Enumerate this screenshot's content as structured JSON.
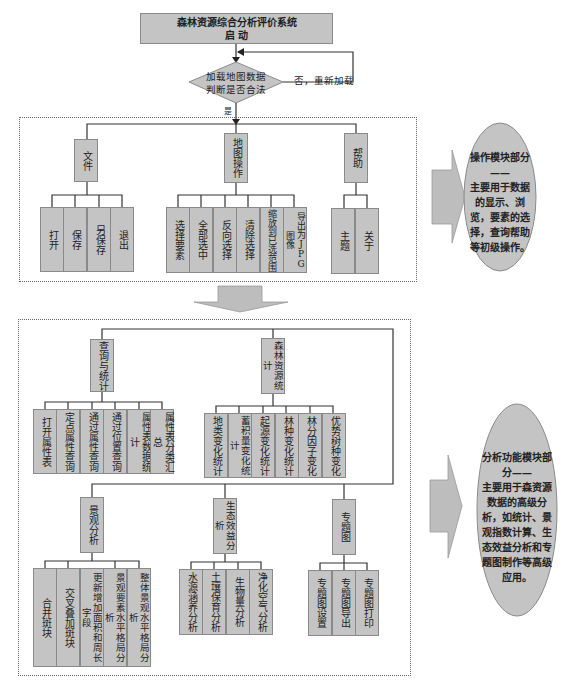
{
  "title": {
    "line1": "森林资源综合分析评价系统",
    "line2": "启 动"
  },
  "decision": {
    "line1": "加载地图数据",
    "line2": "判断是否合法",
    "no_label": "否，重新加载",
    "yes_label": "是"
  },
  "operation_module": {
    "groups": [
      {
        "label": "文件",
        "children": [
          "打开",
          "保存",
          "另保存",
          "退出"
        ]
      },
      {
        "label": "地图操作",
        "children": [
          "选择要素",
          "全部选中",
          "反向选择",
          "清除选择",
          "缩放到已选范围",
          "导出为JPG图像"
        ]
      },
      {
        "label": "帮助",
        "children": [
          "主题",
          "关于"
        ]
      }
    ],
    "description": {
      "title": "操作模块部分——",
      "body": "主要用于数据的显示、浏览，要素的选择，查询帮助等初级操作。"
    }
  },
  "analysis_module": {
    "groups": [
      {
        "label": "查询与统计",
        "children": [
          "打开属性表",
          "定点属性查询",
          "通过属性查询",
          "通过位置查询",
          "属性表数据统计",
          "属性表分类汇总"
        ]
      },
      {
        "label": "森林资源统计",
        "children": [
          "地类变化统计",
          "蓄积量变化统计",
          "起源变化统计",
          "林种变化统计",
          "林分因子变化",
          "优势树种变化"
        ]
      },
      {
        "label": "景观分析",
        "children": [
          "合并斑块",
          "交叉叠加斑块",
          "更新增加面积和周长字段",
          "景观要素水平格局分析",
          "整体景观水平格局分析"
        ]
      },
      {
        "label": "生态效益分析",
        "children": [
          "水源涵养分析",
          "土壤保育分析",
          "生物量分析",
          "净化空气分析"
        ]
      },
      {
        "label": "专题图",
        "children": [
          "专题图设置",
          "专题图导出",
          "专题图打印"
        ]
      }
    ],
    "description": {
      "title": "分析功能模块部分——",
      "body": "主要用于森资源数据的高级分析，如统计、景观指数计算、生态效益分析和专题图制作等高级应用。"
    }
  },
  "colors": {
    "box_fill": "#c4c4c4",
    "line": "#333333",
    "arrow_fill": "#bdbdbd"
  }
}
